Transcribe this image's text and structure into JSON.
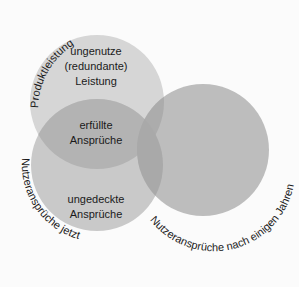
{
  "diagram": {
    "circles": [
      {
        "name": "Produktleistung",
        "cx": 97,
        "cy": 102,
        "r": 67,
        "color": "#d6d6d6"
      },
      {
        "name": "Nutzeransprüche jetzt",
        "cx": 97,
        "cy": 165,
        "r": 66,
        "color": "#c6c6c6"
      },
      {
        "name": "Nutzeransprüche nach einigen Jahren",
        "cx": 203,
        "cy": 150,
        "r": 66,
        "color": "#b8b8b8"
      }
    ],
    "arc_labels": {
      "top": "Produktleistung",
      "bottom_left": "Nutzeransprüche jetzt",
      "right": "Nutzeransprüche nach einigen Jahren"
    },
    "region_labels": {
      "unused_line1": "ungenutze",
      "unused_line2": "(redundante)",
      "unused_line3": "Leistung",
      "fulfilled_line1": "erfüllte",
      "fulfilled_line2": "Ansprüche",
      "uncovered_line1": "ungedeckte",
      "uncovered_line2": "Ansprüche"
    }
  }
}
